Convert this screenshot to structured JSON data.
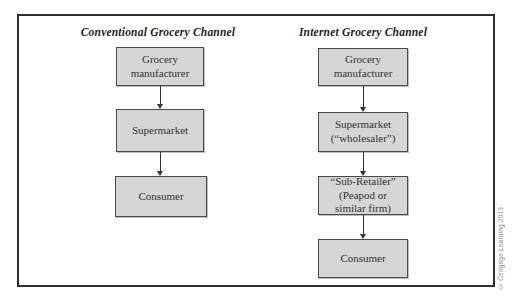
{
  "diagram": {
    "columns": [
      {
        "title": "Conventional Grocery Channel",
        "boxes": [
          {
            "label": "Grocery\nmanufacturer"
          },
          {
            "label": "Supermarket"
          },
          {
            "label": "Consumer"
          }
        ]
      },
      {
        "title": "Internet Grocery Channel",
        "boxes": [
          {
            "label": "Grocery\nmanufacturer"
          },
          {
            "label": "Supermarket\n(“wholesaler”)"
          },
          {
            "label": "“Sub-Retailer”\n(Peapod or\nsimilar firm)"
          },
          {
            "label": "Consumer"
          }
        ]
      }
    ],
    "credit": "© Cengage Learning 2013",
    "colors": {
      "box_fill": "#d5d5d5",
      "box_border": "#4a4a4a",
      "frame_border": "#2f2f2f",
      "text": "#333333",
      "credit_text": "#8a8a8a"
    }
  }
}
